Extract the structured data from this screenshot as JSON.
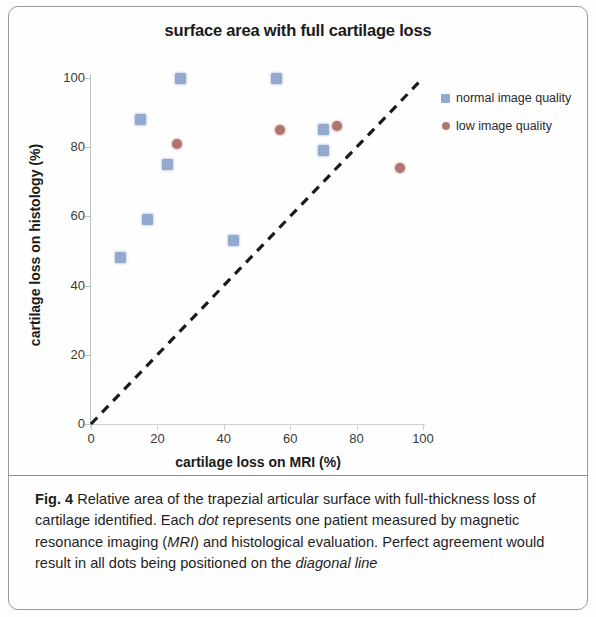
{
  "figure": {
    "label": "Fig. 4",
    "caption_part1": " Relative area of the trapezial articular surface with full-thickness loss of cartilage identified. Each ",
    "caption_em1": "dot",
    "caption_part2": " represents one patient measured by magnetic resonance imaging (",
    "caption_em2": "MRI",
    "caption_part3": ") and histological evaluation. Perfect agreement would result in all dots being positioned on the ",
    "caption_em3": "diagonal line"
  },
  "legend": {
    "items": [
      {
        "label": "normal image quality",
        "marker": "square",
        "color": "#93a9ce"
      },
      {
        "label": "low image quality",
        "marker": "circle",
        "color": "#b3736f"
      }
    ]
  },
  "axes": {
    "x_ticks": [
      "0",
      "20",
      "40",
      "60",
      "80",
      "100"
    ],
    "y_ticks": [
      "0",
      "20",
      "40",
      "60",
      "80",
      "100"
    ]
  },
  "chart_data": {
    "type": "scatter",
    "title": "surface area with full cartilage loss",
    "xlabel": "cartilage loss on MRI (%)",
    "ylabel": "cartilage loss on histology (%)",
    "xlim": [
      0,
      100
    ],
    "ylim": [
      0,
      100
    ],
    "xticks": [
      0,
      20,
      40,
      60,
      80,
      100
    ],
    "yticks": [
      0,
      20,
      40,
      60,
      80,
      100
    ],
    "grid": false,
    "legend_position": "right",
    "annotations": [
      {
        "type": "line",
        "name": "diagonal line of perfect agreement",
        "style": "dashed",
        "color": "#1a1a1a",
        "from": [
          0,
          0
        ],
        "to": [
          100,
          100
        ]
      }
    ],
    "series": [
      {
        "name": "normal image quality",
        "marker": "square",
        "color": "#93a9ce",
        "points": [
          [
            9,
            48
          ],
          [
            15,
            88
          ],
          [
            17,
            59
          ],
          [
            23,
            75
          ],
          [
            27,
            100
          ],
          [
            43,
            53
          ],
          [
            56,
            100
          ],
          [
            70,
            79
          ],
          [
            70,
            85
          ]
        ]
      },
      {
        "name": "low image quality",
        "marker": "circle",
        "color": "#b3736f",
        "points": [
          [
            26,
            81
          ],
          [
            57,
            85
          ],
          [
            74,
            86
          ],
          [
            93,
            74
          ]
        ]
      }
    ]
  }
}
